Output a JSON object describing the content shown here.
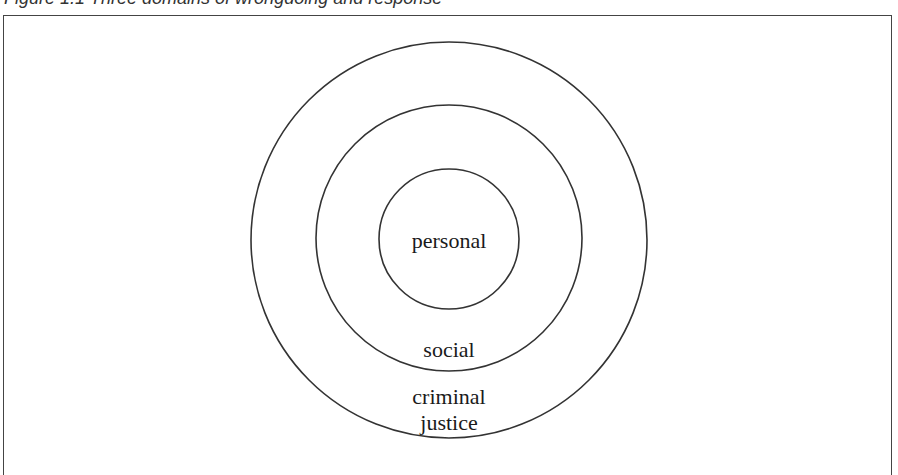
{
  "caption": {
    "text": "Figure 1.1 Three domains of wrongdoing and response",
    "visible": "clipped"
  },
  "diagram": {
    "type": "concentric-circles",
    "stroke_color": "#333333",
    "background": "#ffffff",
    "circles": [
      {
        "id": "outer",
        "label_lines": [
          "criminal",
          "justice"
        ],
        "cx": 449,
        "cy": 240,
        "r": 198
      },
      {
        "id": "middle",
        "label_lines": [
          "social"
        ],
        "cx": 449,
        "cy": 238,
        "r": 133
      },
      {
        "id": "inner",
        "label_lines": [
          "personal"
        ],
        "cx": 449,
        "cy": 239,
        "r": 70
      }
    ]
  },
  "labels": {
    "inner": "personal",
    "middle": "social",
    "outer_line1": "criminal",
    "outer_line2": "justice"
  }
}
